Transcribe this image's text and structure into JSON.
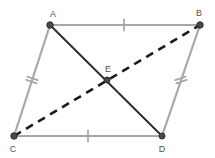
{
  "figure": {
    "type": "geometry-diagram",
    "width": 215,
    "height": 158,
    "background_color": "#ffffff",
    "colors": {
      "side_stroke": "#a8a8a8",
      "diagonal_solid_stroke": "#2b2b2b",
      "diagonal_dashed_stroke": "#1a1a1a",
      "vertex_fill": "#4a4a4a",
      "vertex_stroke": "#2b2b2b",
      "label_text": "#555555",
      "tick_mark": "#a8a8a8"
    },
    "points": [
      {
        "id": "A",
        "label": "A",
        "x": 50,
        "y": 25,
        "label_x": 53,
        "label_y": 17,
        "radius": 3.2
      },
      {
        "id": "B",
        "label": "B",
        "x": 200,
        "y": 25,
        "label_x": 199,
        "label_y": 16,
        "radius": 3.2
      },
      {
        "id": "C",
        "label": "C",
        "x": 14,
        "y": 136,
        "label_x": 13,
        "label_y": 152,
        "radius": 3.2
      },
      {
        "id": "D",
        "label": "D",
        "x": 162,
        "y": 136,
        "label_x": 162,
        "label_y": 152,
        "radius": 3.0
      },
      {
        "id": "E",
        "label": "E",
        "x": 107,
        "y": 80,
        "label_x": 108,
        "label_y": 72,
        "radius": 3.0
      }
    ],
    "sides": [
      {
        "id": "AB",
        "from": "A",
        "to": "B",
        "x1": 50,
        "y1": 25,
        "x2": 200,
        "y2": 25,
        "style": "solid",
        "stroke": "#a8a8a8",
        "width": 2.2,
        "ticks": 1
      },
      {
        "id": "BD",
        "from": "B",
        "to": "D",
        "x1": 200,
        "y1": 25,
        "x2": 162,
        "y2": 136,
        "style": "solid",
        "stroke": "#a8a8a8",
        "width": 2.2,
        "ticks": 2
      },
      {
        "id": "CD",
        "from": "C",
        "to": "D",
        "x1": 14,
        "y1": 136,
        "x2": 162,
        "y2": 136,
        "style": "solid",
        "stroke": "#a8a8a8",
        "width": 2.2,
        "ticks": 1
      },
      {
        "id": "AC",
        "from": "A",
        "to": "C",
        "x1": 50,
        "y1": 25,
        "x2": 14,
        "y2": 136,
        "style": "solid",
        "stroke": "#a8a8a8",
        "width": 2.2,
        "ticks": 2
      }
    ],
    "diagonals": [
      {
        "id": "AD",
        "from": "A",
        "to": "D",
        "x1": 50,
        "y1": 25,
        "x2": 162,
        "y2": 136,
        "style": "solid",
        "stroke": "#2b2b2b",
        "width": 1.9,
        "dash": ""
      },
      {
        "id": "CB",
        "from": "C",
        "to": "B",
        "x1": 14,
        "y1": 136,
        "x2": 200,
        "y2": 25,
        "style": "dashed",
        "stroke": "#1a1a1a",
        "width": 2.6,
        "dash": "8,6"
      }
    ],
    "tick_marks": [
      {
        "id": "tick-AB",
        "side": "AB",
        "cx": 124,
        "cy": 25,
        "angle": 0,
        "count": 1,
        "length": 11,
        "gap": 3.5
      },
      {
        "id": "tick-CD",
        "side": "CD",
        "cx": 88,
        "cy": 136,
        "angle": 0,
        "count": 1,
        "length": 11,
        "gap": 3.5
      },
      {
        "id": "tick-AC",
        "side": "AC",
        "cx": 32,
        "cy": 80,
        "angle": 108,
        "count": 2,
        "length": 11,
        "gap": 3.5
      },
      {
        "id": "tick-BD",
        "side": "BD",
        "cx": 181,
        "cy": 80,
        "angle": 71,
        "count": 2,
        "length": 11,
        "gap": 3.5
      }
    ]
  }
}
